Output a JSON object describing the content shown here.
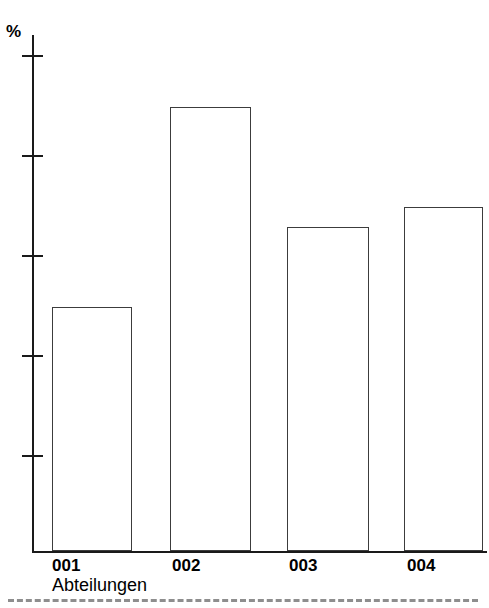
{
  "chart_data": {
    "type": "bar",
    "title": "",
    "subtitle": "",
    "xlabel": "Abteilungen",
    "ylabel": "%",
    "categories": [
      "001",
      "002",
      "003",
      "004"
    ],
    "values": [
      12.4,
      22.4,
      16.4,
      17.4
    ],
    "series": [
      {
        "name": "Anteil",
        "values": [
          12.4,
          22.4,
          16.4,
          17.4
        ]
      }
    ],
    "ylim": [
      0,
      27
    ],
    "yticks": [
      5,
      10,
      15,
      20,
      25
    ],
    "ytick_labels": [
      "5",
      "10",
      "15",
      "20",
      "25"
    ],
    "grid": false,
    "legend": false,
    "legend_position": "none",
    "bar_fill_color": "#ffffff",
    "bar_edge_color": "#3c3c3c",
    "axis_color": "#1a1a1a",
    "annotations": []
  },
  "footer": {
    "rule_color": "#8e8e8e",
    "rule_style": "dashed"
  }
}
